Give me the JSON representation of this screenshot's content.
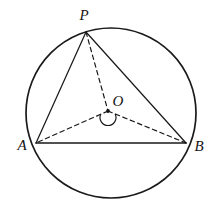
{
  "figure": {
    "canvas": {
      "width": 217,
      "height": 212
    },
    "background_color": "#ffffff",
    "stroke_color": "#1a1a1a",
    "label_color": "#141414",
    "label_font_size": 15
  },
  "circle": {
    "name": "circumcircle",
    "center_x": 111,
    "center_y": 113,
    "radius": 85,
    "stroke_width": 1.7,
    "style": "solid"
  },
  "points": [
    {
      "id": "P",
      "label": "P",
      "x": 86,
      "y": 32,
      "label_x": 84,
      "label_y": 20,
      "marker": false
    },
    {
      "id": "A",
      "label": "A",
      "x": 36,
      "y": 143,
      "label_x": 22,
      "label_y": 150,
      "marker": false
    },
    {
      "id": "B",
      "label": "B",
      "x": 186,
      "y": 143,
      "label_x": 199,
      "label_y": 151,
      "marker": false
    },
    {
      "id": "O",
      "label": "O",
      "x": 108,
      "y": 111,
      "label_x": 118,
      "label_y": 106,
      "marker": true
    }
  ],
  "segments": [
    {
      "id": "PA",
      "label": "PA",
      "from": "P",
      "to": "A",
      "style": "solid",
      "x1": 86,
      "y1": 32,
      "x2": 36,
      "y2": 143,
      "stroke_width": 1.25
    },
    {
      "id": "PB",
      "label": "PB",
      "from": "P",
      "to": "B",
      "style": "solid",
      "x1": 86,
      "y1": 32,
      "x2": 186,
      "y2": 143,
      "stroke_width": 1.25
    },
    {
      "id": "AB",
      "label": "AB",
      "from": "A",
      "to": "B",
      "style": "solid",
      "x1": 36,
      "y1": 143,
      "x2": 186,
      "y2": 143,
      "stroke_width": 1.6
    },
    {
      "id": "PO",
      "label": "PO",
      "from": "P",
      "to": "O",
      "style": "dashed",
      "x1": 86,
      "y1": 32,
      "x2": 108,
      "y2": 111,
      "stroke_width": 1.2
    },
    {
      "id": "OA",
      "label": "OA",
      "from": "O",
      "to": "A",
      "style": "dashed",
      "x1": 108,
      "y1": 111,
      "x2": 36,
      "y2": 143,
      "stroke_width": 1.2
    },
    {
      "id": "OB",
      "label": "OB",
      "from": "O",
      "to": "B",
      "style": "dashed",
      "x1": 108,
      "y1": 111,
      "x2": 186,
      "y2": 143,
      "stroke_width": 1.2
    }
  ],
  "angle_marks": [
    {
      "id": "reflex-AOB",
      "label": "reflex angle AOB",
      "at": "O",
      "center_x": 108,
      "center_y": 111,
      "radius": 8,
      "start_deg": 156,
      "end_deg": 24,
      "sweep": "reflex",
      "stroke_width": 1.2
    }
  ],
  "center_dot": {
    "label": "center point O",
    "x": 108,
    "y": 111,
    "radius": 1.9
  },
  "labels": {
    "P": "P",
    "A": "A",
    "B": "B",
    "O": "O"
  }
}
